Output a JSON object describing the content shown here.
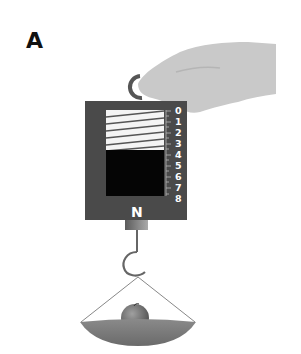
{
  "figure": {
    "panel_label": "A",
    "device": "spring-scale",
    "unit_label": "N",
    "scale_ticks": [
      "0",
      "1",
      "2",
      "3",
      "4",
      "5",
      "6",
      "7",
      "8"
    ],
    "load": "apple-in-pan",
    "colors": {
      "body": "#4a4a4a",
      "spring_window": "#f4f4f4",
      "spring_coil": "#555555",
      "indicator_block": "#050505",
      "hand": "#c9c9c9",
      "pan": "#7a7a7a",
      "apple": "#707070",
      "hook": "#555555"
    }
  }
}
